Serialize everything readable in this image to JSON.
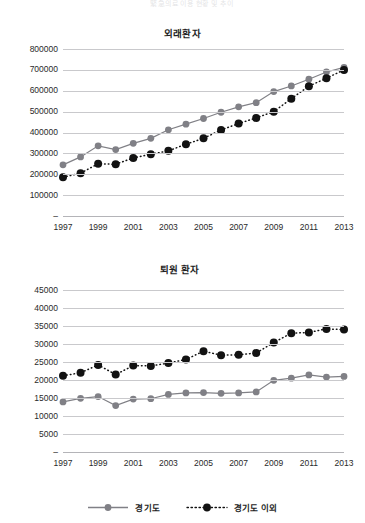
{
  "header": {
    "cut_text": "緊急의료 이용 현황 및 추이"
  },
  "legend": {
    "position": "bottom-center",
    "items": [
      {
        "label": "경기도",
        "color": "#808086",
        "style": "solid",
        "marker": "circle"
      },
      {
        "label": "경기도 이외",
        "color": "#121212",
        "style": "dotted",
        "marker": "circle"
      }
    ]
  },
  "charts": [
    {
      "id": "outpatients",
      "title": "외래환자",
      "ytick_labels": [
        "800000",
        "700000",
        "600000",
        "500000",
        "400000",
        "300000",
        "200000",
        "100000",
        "–"
      ],
      "xtick_labels": [
        "1997",
        "1999",
        "2001",
        "2003",
        "2005",
        "2007",
        "2009",
        "2011",
        "2013"
      ]
    },
    {
      "id": "discharged",
      "title": "퇴원 환자",
      "ytick_labels": [
        "45000",
        "40000",
        "35000",
        "30000",
        "25000",
        "20000",
        "15000",
        "10000",
        "5000",
        "–"
      ],
      "xtick_labels": [
        "1997",
        "1999",
        "2001",
        "2003",
        "2005",
        "2007",
        "2009",
        "2011",
        "2013"
      ]
    }
  ],
  "chart_data": [
    {
      "type": "line",
      "id": "outpatients",
      "title": "외래환자",
      "xlabel": "",
      "ylabel": "",
      "grid": true,
      "legend_position": "bottom-center",
      "x": [
        1997,
        1998,
        1999,
        2000,
        2001,
        2002,
        2003,
        2004,
        2005,
        2006,
        2007,
        2008,
        2009,
        2010,
        2011,
        2012,
        2013
      ],
      "xlim": [
        1997,
        2013
      ],
      "ylim": [
        0,
        800000
      ],
      "yticks": [
        0,
        100000,
        200000,
        300000,
        400000,
        500000,
        600000,
        700000,
        800000
      ],
      "xticks": [
        1997,
        1999,
        2001,
        2003,
        2005,
        2007,
        2009,
        2011,
        2013
      ],
      "series": [
        {
          "name": "경기도",
          "color": "#808086",
          "style": "solid",
          "values": [
            245000,
            283000,
            336000,
            318000,
            348000,
            372000,
            413000,
            440000,
            467000,
            497000,
            523000,
            543000,
            596000,
            623000,
            655000,
            690000,
            712000
          ]
        },
        {
          "name": "경기도 이외",
          "color": "#121212",
          "style": "dotted",
          "values": [
            186000,
            205000,
            250000,
            248000,
            278000,
            296000,
            312000,
            344000,
            372000,
            412000,
            443000,
            470000,
            500000,
            562000,
            622000,
            660000,
            700000
          ]
        }
      ]
    },
    {
      "type": "line",
      "id": "discharged",
      "title": "퇴원 환자",
      "xlabel": "",
      "ylabel": "",
      "grid": true,
      "legend_position": "bottom-center",
      "x": [
        1997,
        1998,
        1999,
        2000,
        2001,
        2002,
        2003,
        2004,
        2005,
        2006,
        2007,
        2008,
        2009,
        2010,
        2011,
        2012,
        2013
      ],
      "xlim": [
        1997,
        2013
      ],
      "ylim": [
        0,
        45000
      ],
      "yticks": [
        0,
        5000,
        10000,
        15000,
        20000,
        25000,
        30000,
        35000,
        40000,
        45000
      ],
      "xticks": [
        1997,
        1999,
        2001,
        2003,
        2005,
        2007,
        2009,
        2011,
        2013
      ],
      "series": [
        {
          "name": "경기도",
          "color": "#808086",
          "style": "solid",
          "values": [
            13900,
            14900,
            15400,
            12900,
            14700,
            14800,
            16000,
            16400,
            16500,
            16300,
            16400,
            16700,
            19900,
            20500,
            21400,
            20800,
            21000
          ]
        },
        {
          "name": "경기도 이외",
          "color": "#121212",
          "style": "dotted",
          "values": [
            21200,
            22000,
            24200,
            21500,
            24000,
            23900,
            24700,
            25700,
            28000,
            26900,
            27000,
            27500,
            30400,
            33000,
            33200,
            34200,
            34000
          ]
        }
      ]
    }
  ]
}
